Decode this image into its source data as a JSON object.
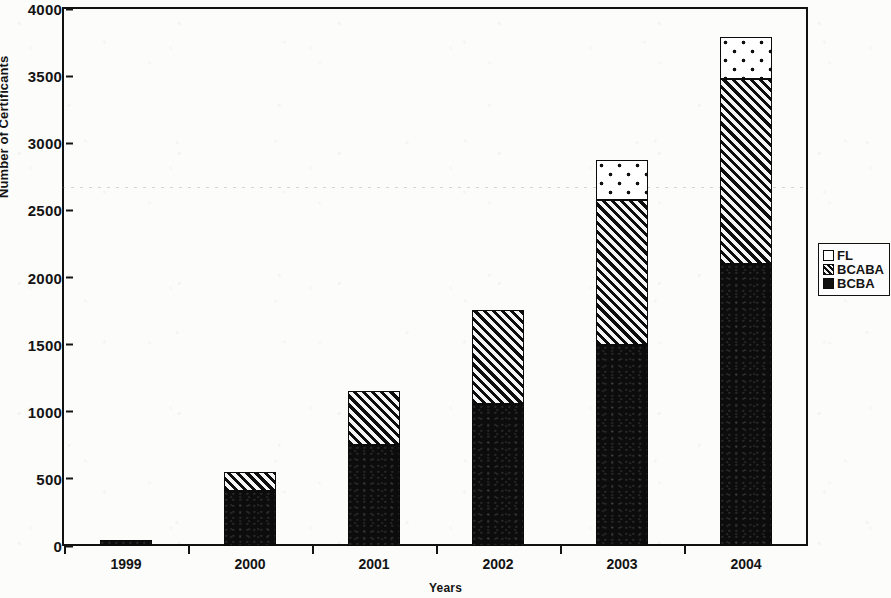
{
  "chart_data": {
    "type": "bar",
    "stacked": true,
    "title": "",
    "xlabel": "Years",
    "ylabel": "Number of Certificants",
    "categories": [
      "1999",
      "2000",
      "2001",
      "2002",
      "2003",
      "2004"
    ],
    "series": [
      {
        "name": "BCBA",
        "fill": "solid-black",
        "values": [
          45,
          412,
          750,
          1060,
          1500,
          2100
        ]
      },
      {
        "name": "BCABA",
        "fill": "diagonal-hatch",
        "values": [
          0,
          143,
          405,
          700,
          1075,
          1375
        ]
      },
      {
        "name": "FL",
        "fill": "dotted-white",
        "values": [
          0,
          0,
          0,
          0,
          300,
          315
        ]
      }
    ],
    "totals": [
      45,
      555,
      1155,
      1760,
      2875,
      3790
    ],
    "ylim": [
      0,
      4000
    ],
    "yticks": [
      0,
      500,
      1000,
      1500,
      2000,
      2500,
      3000,
      3500,
      4000
    ],
    "ytick_labels": [
      "0",
      "500",
      "1000",
      "1500",
      "2000",
      "2500",
      "3000",
      "3500",
      "4000"
    ],
    "grid": false,
    "legend_position": "right",
    "legend_order": [
      "FL",
      "BCABA",
      "BCBA"
    ],
    "colors": {
      "axis": "#141414",
      "bcba": "#0c0c0c",
      "bcaba_hatch": "#0d0d0d",
      "bcaba_bg": "#f2f2f2",
      "fl_bg": "#ffffff",
      "fl_dots": "#111111",
      "background": "#fcfcfb"
    }
  },
  "axes": {
    "y_title": "Number of Certificants",
    "x_title": "Years"
  },
  "legend": {
    "items": [
      {
        "label": "FL",
        "swatch": "fl-swatch-icon"
      },
      {
        "label": "BCABA",
        "swatch": "bcaba-swatch-icon"
      },
      {
        "label": "BCBA",
        "swatch": "bcba-swatch-icon"
      }
    ]
  }
}
